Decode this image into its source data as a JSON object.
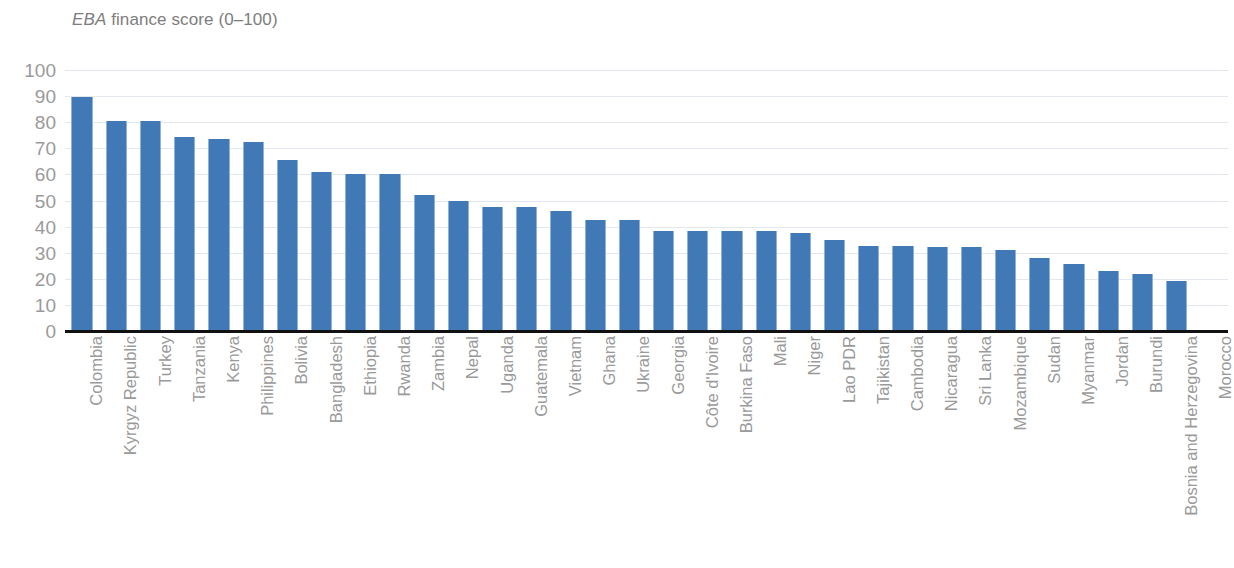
{
  "chart_data": {
    "type": "bar",
    "title": "EBA finance score (0–100)",
    "title_emphasis": "EBA",
    "title_rest": " finance score (0–100)",
    "xlabel": "",
    "ylabel": "",
    "ylim": [
      0,
      100
    ],
    "yticks": [
      100,
      90,
      80,
      70,
      60,
      50,
      40,
      30,
      20,
      10,
      0
    ],
    "grid": true,
    "legend": "none",
    "bar_color": "#4179b6",
    "axis_color": "#111111",
    "gridline_color": "#e2e7ee",
    "tick_label_color": "#9a9a9a",
    "categories": [
      "Colombia",
      "Kyrgyz Republic",
      "Turkey",
      "Tanzania",
      "Kenya",
      "Philippines",
      "Bolivia",
      "Bangladesh",
      "Ethiopia",
      "Rwanda",
      "Zambia",
      "Nepal",
      "Uganda",
      "Guatemala",
      "Vietnam",
      "Ghana",
      "Ukraine",
      "Georgia",
      "Côte d'Ivoire",
      "Burkina Faso",
      "Mali",
      "Niger",
      "Lao PDR",
      "Tajikistan",
      "Cambodia",
      "Nicaragua",
      "Sri Lanka",
      "Mozambique",
      "Sudan",
      "Myanmar",
      "Jordan",
      "Burundi",
      "Bosnia and Herzegovina",
      "Morocco"
    ],
    "values": [
      89.5,
      80.5,
      80.5,
      74.5,
      73.5,
      72.5,
      65.5,
      61,
      60,
      60,
      52,
      50,
      47.5,
      47.5,
      46,
      42.5,
      42.5,
      38.5,
      38.5,
      38.5,
      38.5,
      37.5,
      35,
      32.5,
      32.5,
      32,
      32,
      31,
      28,
      25.5,
      23,
      22,
      19,
      null
    ]
  }
}
